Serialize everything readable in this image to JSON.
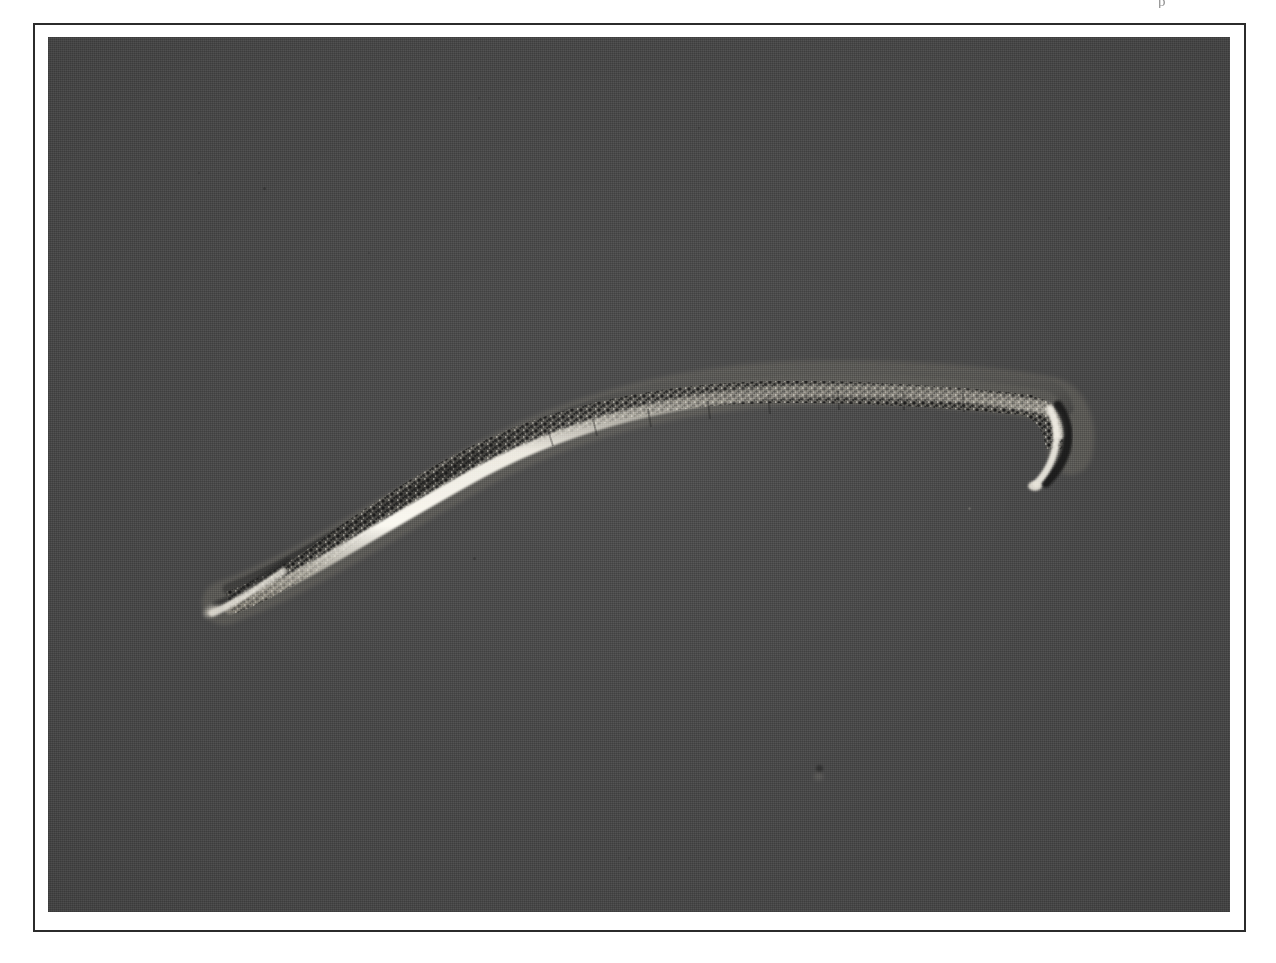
{
  "page": {
    "background_color": "#ffffff",
    "artifact_glyph": "p",
    "artifact_note": "partial character clipped at top edge of scan"
  },
  "plate": {
    "frame_color": "#2b2b2b",
    "frame_border_width_px": 2,
    "mat_color": "#ffffff",
    "frame_rect": {
      "x": 33,
      "y": 23,
      "width": 1213,
      "height": 909
    }
  },
  "micrograph": {
    "name": "nematode-micrograph",
    "modality": "differential interference contrast light micrograph",
    "subject": "nematode worm (whole mount, lateral view)",
    "background_color": "#4d4d4d",
    "highlight_color": "#f2f0ea",
    "shadow_color": "#1a1a1a",
    "photo_rect": {
      "x": 13,
      "y": 12,
      "width": 1182,
      "height": 875
    },
    "orientation": "anterior at lower-left, posterior hooked downward at right",
    "specimen": {
      "body_outline_note": "sigmoid body: tapered tip lower-left, arcing up and right, flattening across upper third, then a sharp ventral hook at the right terminus",
      "dark_dorsal_edge": "#1e1e1e",
      "bright_cuticle_edge": "#efece4",
      "granular_interior": "#2a2a2a"
    },
    "debris_specks": [
      {
        "x": 215,
        "y": 150,
        "size": 3
      },
      {
        "x": 150,
        "y": 135,
        "size": 2
      },
      {
        "x": 430,
        "y": 60,
        "size": 2
      },
      {
        "x": 650,
        "y": 90,
        "size": 2
      },
      {
        "x": 425,
        "y": 520,
        "size": 3
      },
      {
        "x": 920,
        "y": 470,
        "size": 2
      },
      {
        "x": 770,
        "y": 730,
        "size": 5
      },
      {
        "x": 320,
        "y": 215,
        "size": 2
      },
      {
        "x": 1060,
        "y": 180,
        "size": 2
      },
      {
        "x": 580,
        "y": 820,
        "size": 2
      }
    ]
  }
}
